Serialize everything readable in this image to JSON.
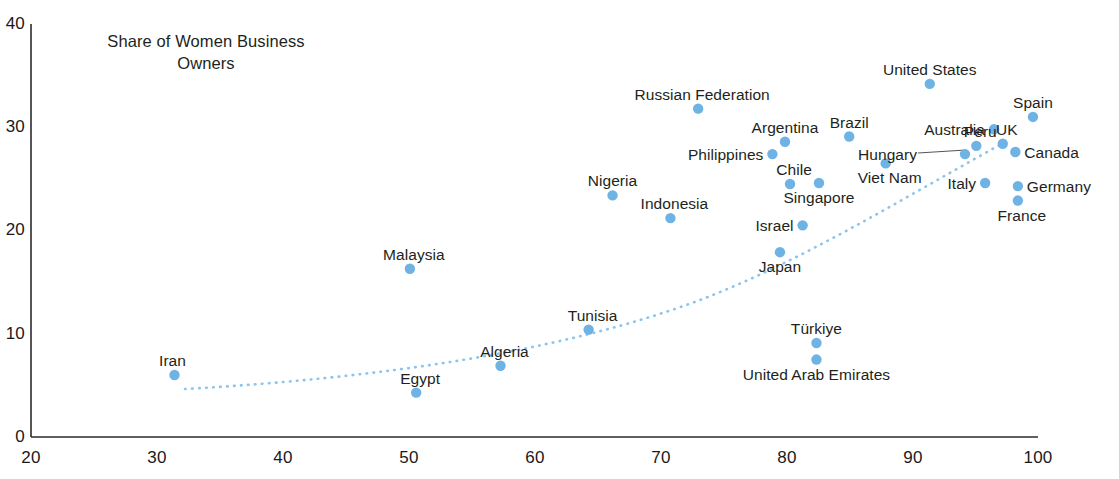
{
  "chart_data": {
    "type": "scatter",
    "title": "Share of Women Business\nOwners",
    "xlabel": "",
    "ylabel": "",
    "xlim": [
      20,
      100
    ],
    "ylim": [
      0,
      40
    ],
    "xticks": [
      20,
      30,
      40,
      50,
      60,
      70,
      80,
      90,
      100
    ],
    "yticks": [
      0,
      10,
      20,
      30,
      40
    ],
    "grid": false,
    "legend": "none",
    "marker_color": "#6fb2e4",
    "trend_line": {
      "style": "dotted",
      "color": "#8cc4ec",
      "description": "upward-curving dotted trend line from low-left to upper-right"
    },
    "points": [
      {
        "label": "Iran",
        "x": 31.4,
        "y": 6.0,
        "label_pos": "left-above"
      },
      {
        "label": "Egypt",
        "x": 50.6,
        "y": 4.3,
        "label_pos": "above-left"
      },
      {
        "label": "Malaysia",
        "x": 50.1,
        "y": 16.3,
        "label_pos": "above-left"
      },
      {
        "label": "Algeria",
        "x": 57.3,
        "y": 6.9,
        "label_pos": "above-left"
      },
      {
        "label": "Tunisia",
        "x": 64.3,
        "y": 10.4,
        "label_pos": "above-left"
      },
      {
        "label": "Nigeria",
        "x": 66.2,
        "y": 23.4,
        "label_pos": "above"
      },
      {
        "label": "Indonesia",
        "x": 70.8,
        "y": 21.2,
        "label_pos": "above-left"
      },
      {
        "label": "Russian Federation",
        "x": 73.0,
        "y": 31.8,
        "label_pos": "above-left"
      },
      {
        "label": "Philippines",
        "x": 78.9,
        "y": 27.4,
        "label_pos": "left"
      },
      {
        "label": "Argentina",
        "x": 79.9,
        "y": 28.6,
        "label_pos": "above"
      },
      {
        "label": "Chile",
        "x": 80.3,
        "y": 24.5,
        "label_pos": "above-left"
      },
      {
        "label": "Singapore",
        "x": 82.6,
        "y": 24.6,
        "label_pos": "below"
      },
      {
        "label": "Israel",
        "x": 81.3,
        "y": 20.5,
        "label_pos": "left"
      },
      {
        "label": "Japan",
        "x": 79.5,
        "y": 17.9,
        "label_pos": "below"
      },
      {
        "label": "Türkiye",
        "x": 82.4,
        "y": 9.1,
        "label_pos": "above"
      },
      {
        "label": "United Arab Emirates",
        "x": 82.4,
        "y": 7.5,
        "label_pos": "below"
      },
      {
        "label": "Brazil",
        "x": 85.0,
        "y": 29.1,
        "label_pos": "above"
      },
      {
        "label": "Viet Nam",
        "x": 87.9,
        "y": 26.5,
        "label_pos": "below-left"
      },
      {
        "label": "United States",
        "x": 91.4,
        "y": 34.2,
        "label_pos": "above"
      },
      {
        "label": "Hungary",
        "x": 94.2,
        "y": 27.4,
        "label_pos": "left-leader"
      },
      {
        "label": "Peru",
        "x": 95.1,
        "y": 28.2,
        "label_pos": "above-left"
      },
      {
        "label": "Italy",
        "x": 95.8,
        "y": 24.6,
        "label_pos": "left"
      },
      {
        "label": "Australia",
        "x": 96.5,
        "y": 29.8,
        "label_pos": "left"
      },
      {
        "label": "UK",
        "x": 97.2,
        "y": 28.4,
        "label_pos": "above-left"
      },
      {
        "label": "Canada",
        "x": 98.2,
        "y": 27.6,
        "label_pos": "right"
      },
      {
        "label": "Germany",
        "x": 98.4,
        "y": 24.3,
        "label_pos": "right"
      },
      {
        "label": "France",
        "x": 98.4,
        "y": 22.9,
        "label_pos": "below-right"
      },
      {
        "label": "Spain",
        "x": 99.6,
        "y": 31.0,
        "label_pos": "above"
      }
    ]
  },
  "axes": {
    "y_tick_labels": [
      "40",
      "30",
      "20",
      "10",
      "0"
    ],
    "x_tick_labels": [
      "20",
      "30",
      "40",
      "50",
      "60",
      "70",
      "80",
      "90",
      "100"
    ]
  }
}
